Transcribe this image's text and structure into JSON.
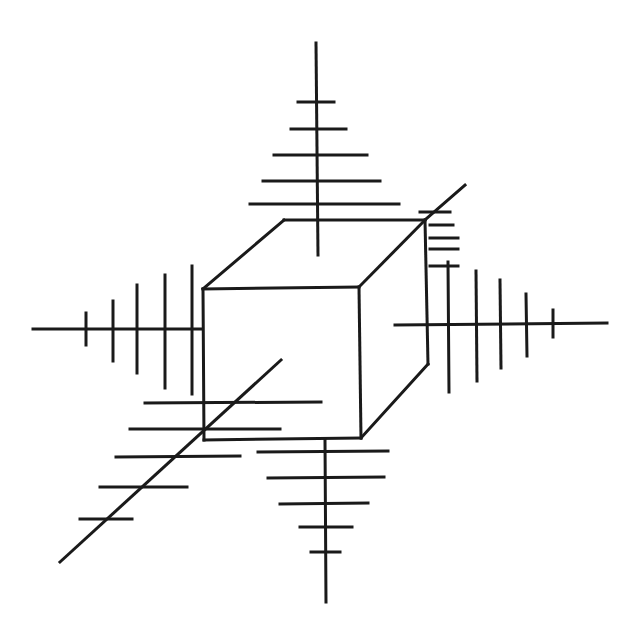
{
  "diagram": {
    "type": "line-art",
    "width": 639,
    "height": 636,
    "stroke_color": "#1a1a1a",
    "background": "#ffffff",
    "stroke_width": 3,
    "cube": {
      "front_face": [
        [
          203,
          289
        ],
        [
          359,
          287
        ],
        [
          361,
          438
        ],
        [
          204,
          440
        ]
      ],
      "back_face": [
        [
          284,
          220
        ],
        [
          425,
          220
        ],
        [
          428,
          364
        ]
      ],
      "connectors": [
        [
          [
            203,
            289
          ],
          [
            284,
            220
          ]
        ],
        [
          [
            359,
            287
          ],
          [
            425,
            220
          ]
        ],
        [
          [
            361,
            438
          ],
          [
            428,
            364
          ]
        ]
      ]
    },
    "axes": [
      {
        "name": "top",
        "line": [
          [
            316,
            43
          ],
          [
            318,
            255
          ]
        ],
        "ticks": [
          [
            [
              298,
              102
            ],
            [
              334,
              102
            ]
          ],
          [
            [
              291,
              129
            ],
            [
              346,
              129
            ]
          ],
          [
            [
              274,
              155
            ],
            [
              367,
              155
            ]
          ],
          [
            [
              263,
              181
            ],
            [
              380,
              181
            ]
          ],
          [
            [
              250,
              204
            ],
            [
              399,
              204
            ]
          ]
        ]
      },
      {
        "name": "bottom",
        "line": [
          [
            325,
            440
          ],
          [
            326,
            602
          ]
        ],
        "ticks": [
          [
            [
              258,
              452
            ],
            [
              388,
              451
            ]
          ],
          [
            [
              268,
              478
            ],
            [
              384,
              477
            ]
          ],
          [
            [
              280,
              504
            ],
            [
              368,
              503
            ]
          ],
          [
            [
              300,
              527
            ],
            [
              352,
              527
            ]
          ],
          [
            [
              311,
              552
            ],
            [
              340,
              552
            ]
          ]
        ]
      },
      {
        "name": "left",
        "line": [
          [
            33,
            329
          ],
          [
            202,
            329
          ]
        ],
        "ticks": [
          [
            [
              86,
              313
            ],
            [
              86,
              345
            ]
          ],
          [
            [
              113,
              301
            ],
            [
              113,
              361
            ]
          ],
          [
            [
              137,
              285
            ],
            [
              137,
              373
            ]
          ],
          [
            [
              165,
              275
            ],
            [
              165,
              388
            ]
          ],
          [
            [
              192,
              266
            ],
            [
              192,
              394
            ]
          ]
        ]
      },
      {
        "name": "right",
        "line": [
          [
            395,
            325
          ],
          [
            607,
            323
          ]
        ],
        "ticks": [
          [
            [
              448,
              262
            ],
            [
              449,
              392
            ]
          ],
          [
            [
              476,
              271
            ],
            [
              477,
              381
            ]
          ],
          [
            [
              500,
              280
            ],
            [
              501,
              368
            ]
          ],
          [
            [
              526,
              294
            ],
            [
              527,
              356
            ]
          ],
          [
            [
              553,
              310
            ],
            [
              553,
              337
            ]
          ]
        ]
      },
      {
        "name": "diagonal-back",
        "line": [
          [
            425,
            220
          ],
          [
            465,
            185
          ]
        ],
        "ticks": [
          [
            [
              420,
              212
            ],
            [
              450,
              212
            ]
          ],
          [
            [
              430,
              225
            ],
            [
              453,
              225
            ]
          ],
          [
            [
              430,
              238
            ],
            [
              458,
              238
            ]
          ],
          [
            [
              430,
              249
            ],
            [
              458,
              249
            ]
          ],
          [
            [
              430,
              266
            ],
            [
              458,
              266
            ]
          ]
        ]
      },
      {
        "name": "diagonal-front",
        "line": [
          [
            281,
            360
          ],
          [
            60,
            562
          ]
        ],
        "ticks": [
          [
            [
              145,
              403
            ],
            [
              321,
              402
            ]
          ],
          [
            [
              130,
              429
            ],
            [
              280,
              429
            ]
          ],
          [
            [
              116,
              457
            ],
            [
              240,
              456
            ]
          ],
          [
            [
              100,
              487
            ],
            [
              187,
              487
            ]
          ],
          [
            [
              80,
              519
            ],
            [
              132,
              519
            ]
          ]
        ]
      }
    ]
  }
}
